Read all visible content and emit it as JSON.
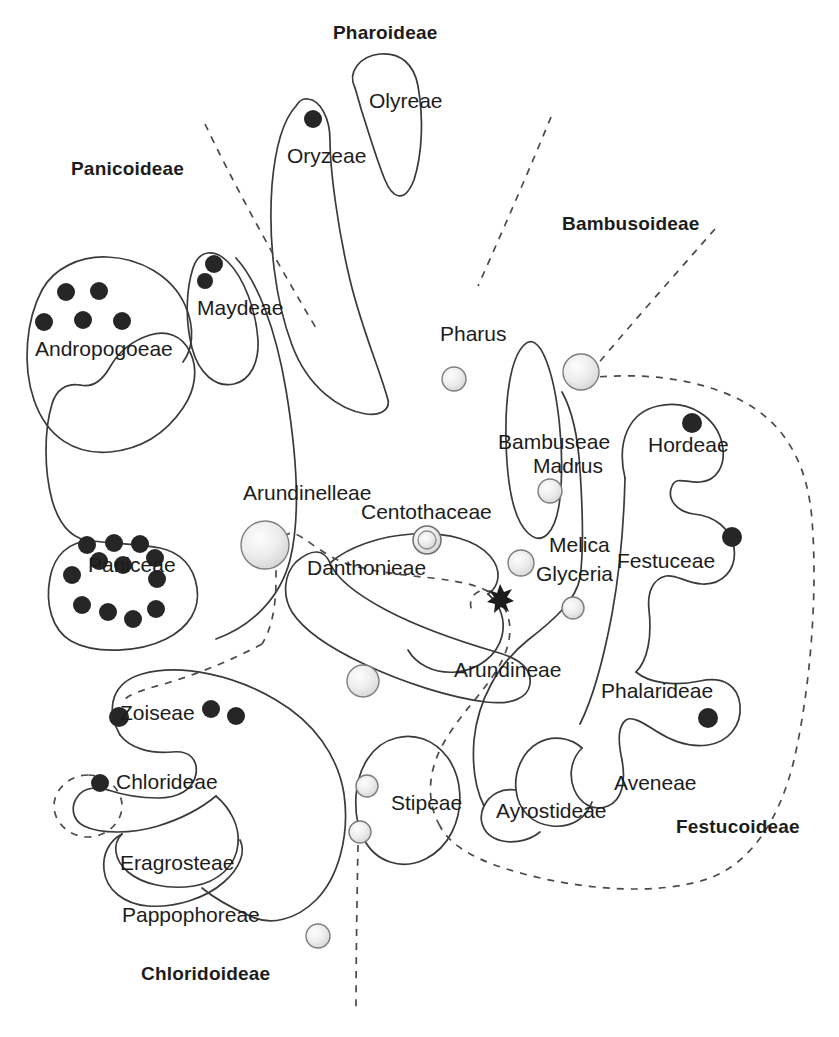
{
  "diagram": {
    "title_present": false,
    "type": "taxonomic-cluster-venn",
    "colors": {
      "outline": "#3a3a3a",
      "dashed_boundary": "#4a4a4a",
      "dark_marker": "#262626",
      "light_marker_fill": "#e8e8e8",
      "light_marker_stroke": "#7d7d7d",
      "text": "#1c1c1c",
      "background": "#ffffff"
    },
    "subfamilies": [
      {
        "id": "pharoideae",
        "label": "Pharoideae",
        "x": 333,
        "y": 22,
        "bold": true
      },
      {
        "id": "panicoideae",
        "label": "Panicoideae",
        "x": 71,
        "y": 158,
        "bold": true
      },
      {
        "id": "bambusoideae",
        "label": "Bambusoideae",
        "x": 562,
        "y": 213,
        "bold": true
      },
      {
        "id": "festucoideae",
        "label": "Festucoideae",
        "x": 676,
        "y": 816,
        "bold": true
      },
      {
        "id": "chloridoideae",
        "label": "Chloridoideae",
        "x": 141,
        "y": 963,
        "bold": true
      }
    ],
    "tribes": [
      {
        "id": "olyreae",
        "label": "Olyreae",
        "x": 369,
        "y": 89,
        "markers_dark": 0,
        "markers_light": 0
      },
      {
        "id": "oryzeae",
        "label": "Oryzeae",
        "x": 287,
        "y": 144,
        "markers_dark": 1,
        "markers_light": 0
      },
      {
        "id": "maydeae",
        "label": "Maydeae",
        "x": 197,
        "y": 296,
        "markers_dark": 2,
        "markers_light": 0
      },
      {
        "id": "andropogoeae",
        "label": "Andropogoeae",
        "x": 35,
        "y": 337,
        "markers_dark": 5,
        "markers_light": 0
      },
      {
        "id": "pharus",
        "label": "Pharus",
        "x": 440,
        "y": 322,
        "markers_dark": 0,
        "markers_light": 1
      },
      {
        "id": "bambuseae",
        "label": "Bambuseae",
        "x": 498,
        "y": 430,
        "markers_dark": 0,
        "markers_light": 1
      },
      {
        "id": "madrus",
        "label": "Madrus",
        "x": 533,
        "y": 454,
        "markers_dark": 0,
        "markers_light": 1
      },
      {
        "id": "hordeae",
        "label": "Hordeae",
        "x": 648,
        "y": 433,
        "markers_dark": 1,
        "markers_light": 0
      },
      {
        "id": "arundinelleae",
        "label": "Arundinelleae",
        "x": 243,
        "y": 481,
        "markers_dark": 0,
        "markers_light": 1
      },
      {
        "id": "centothaceae",
        "label": "Centothaceae",
        "x": 361,
        "y": 500,
        "markers_dark": 0,
        "markers_light": 1
      },
      {
        "id": "melica",
        "label": "Melica",
        "x": 549,
        "y": 533,
        "markers_dark": 0,
        "markers_light": 1
      },
      {
        "id": "festuceae",
        "label": "Festuceae",
        "x": 617,
        "y": 549,
        "markers_dark": 1,
        "markers_light": 0
      },
      {
        "id": "paniceae",
        "label": "Paniceae",
        "x": 88,
        "y": 553,
        "markers_dark": 12,
        "markers_light": 0
      },
      {
        "id": "danthonieae",
        "label": "Danthonieae",
        "x": 307,
        "y": 556,
        "markers_dark": 0,
        "markers_light": 0
      },
      {
        "id": "glyceria",
        "label": "Glyceria",
        "x": 536,
        "y": 562,
        "markers_dark": 0,
        "markers_light": 1
      },
      {
        "id": "arundineae",
        "label": "Arundineae",
        "x": 454,
        "y": 658,
        "markers_dark": 0,
        "markers_light": 1
      },
      {
        "id": "phalarideae",
        "label": "Phalarideae",
        "x": 601,
        "y": 679,
        "markers_dark": 1,
        "markers_light": 0
      },
      {
        "id": "zoiseae",
        "label": "Zoiseae",
        "x": 120,
        "y": 701,
        "markers_dark": 3,
        "markers_light": 0
      },
      {
        "id": "chlorideae",
        "label": "Chlorideae",
        "x": 116,
        "y": 770,
        "markers_dark": 1,
        "markers_light": 0
      },
      {
        "id": "aveneae",
        "label": "Aveneae",
        "x": 614,
        "y": 771,
        "markers_dark": 0,
        "markers_light": 0
      },
      {
        "id": "stipeae",
        "label": "Stipeae",
        "x": 391,
        "y": 791,
        "markers_dark": 0,
        "markers_light": 2
      },
      {
        "id": "ayrostideae",
        "label": "Ayrostideae",
        "x": 496,
        "y": 799,
        "markers_dark": 0,
        "markers_light": 0
      },
      {
        "id": "eragrosteae",
        "label": "Eragrosteae",
        "x": 120,
        "y": 851,
        "markers_dark": 0,
        "markers_light": 0
      },
      {
        "id": "pappophoreae",
        "label": "Pappophoreae",
        "x": 122,
        "y": 903,
        "markers_dark": 0,
        "markers_light": 0
      }
    ],
    "markers": {
      "dark_dots": [
        {
          "cx": 313,
          "cy": 119,
          "r": 9,
          "tribe": "oryzeae"
        },
        {
          "cx": 214,
          "cy": 264,
          "r": 9,
          "tribe": "maydeae"
        },
        {
          "cx": 205,
          "cy": 281,
          "r": 8,
          "tribe": "maydeae"
        },
        {
          "cx": 66,
          "cy": 292,
          "r": 9,
          "tribe": "andropogoeae"
        },
        {
          "cx": 99,
          "cy": 291,
          "r": 9,
          "tribe": "andropogoeae"
        },
        {
          "cx": 44,
          "cy": 322,
          "r": 9,
          "tribe": "andropogoeae"
        },
        {
          "cx": 83,
          "cy": 320,
          "r": 9,
          "tribe": "andropogoeae"
        },
        {
          "cx": 122,
          "cy": 321,
          "r": 9,
          "tribe": "andropogoeae"
        },
        {
          "cx": 692,
          "cy": 423,
          "r": 10,
          "tribe": "hordeae"
        },
        {
          "cx": 732,
          "cy": 537,
          "r": 10,
          "tribe": "festuceae"
        },
        {
          "cx": 87,
          "cy": 545,
          "r": 9,
          "tribe": "paniceae"
        },
        {
          "cx": 114,
          "cy": 543,
          "r": 9,
          "tribe": "paniceae"
        },
        {
          "cx": 140,
          "cy": 544,
          "r": 9,
          "tribe": "paniceae"
        },
        {
          "cx": 155,
          "cy": 558,
          "r": 9,
          "tribe": "paniceae"
        },
        {
          "cx": 99,
          "cy": 561,
          "r": 9,
          "tribe": "paniceae"
        },
        {
          "cx": 123,
          "cy": 565,
          "r": 9,
          "tribe": "paniceae"
        },
        {
          "cx": 72,
          "cy": 575,
          "r": 9,
          "tribe": "paniceae"
        },
        {
          "cx": 82,
          "cy": 605,
          "r": 9,
          "tribe": "paniceae"
        },
        {
          "cx": 108,
          "cy": 612,
          "r": 9,
          "tribe": "paniceae"
        },
        {
          "cx": 133,
          "cy": 619,
          "r": 9,
          "tribe": "paniceae"
        },
        {
          "cx": 156,
          "cy": 609,
          "r": 9,
          "tribe": "paniceae"
        },
        {
          "cx": 157,
          "cy": 579,
          "r": 9,
          "tribe": "paniceae"
        },
        {
          "cx": 708,
          "cy": 718,
          "r": 10,
          "tribe": "phalarideae"
        },
        {
          "cx": 119,
          "cy": 717,
          "r": 10,
          "tribe": "zoiseae"
        },
        {
          "cx": 211,
          "cy": 709,
          "r": 9,
          "tribe": "zoiseae"
        },
        {
          "cx": 236,
          "cy": 716,
          "r": 9,
          "tribe": "zoiseae"
        },
        {
          "cx": 100,
          "cy": 783,
          "r": 9,
          "tribe": "chlorideae"
        }
      ],
      "light_circles": [
        {
          "cx": 454,
          "cy": 379,
          "r": 12,
          "tribe": "pharus"
        },
        {
          "cx": 581,
          "cy": 372,
          "r": 18,
          "tribe": "bambuseae"
        },
        {
          "cx": 550,
          "cy": 491,
          "r": 12,
          "tribe": "madrus"
        },
        {
          "cx": 265,
          "cy": 545,
          "r": 24,
          "tribe": "arundinelleae"
        },
        {
          "cx": 427,
          "cy": 540,
          "r": 14,
          "tribe": "centothaceae",
          "double_ring": true
        },
        {
          "cx": 521,
          "cy": 563,
          "r": 13,
          "tribe": "melica"
        },
        {
          "cx": 573,
          "cy": 608,
          "r": 11,
          "tribe": "glyceria"
        },
        {
          "cx": 363,
          "cy": 681,
          "r": 16,
          "tribe": "arundineae"
        },
        {
          "cx": 367,
          "cy": 786,
          "r": 11,
          "tribe": "stipeae"
        },
        {
          "cx": 360,
          "cy": 832,
          "r": 11,
          "tribe": "stipeae"
        },
        {
          "cx": 318,
          "cy": 936,
          "r": 12,
          "tribe": "chloridoideae-outer"
        }
      ],
      "stars": [
        {
          "cx": 500,
          "cy": 596,
          "r": 11,
          "points": 6
        }
      ]
    },
    "dashed_boundaries": [
      {
        "id": "panicoideae-pharoideae-divider"
      },
      {
        "id": "pharoideae-bambusoideae-divider"
      },
      {
        "id": "bambusoideae-upper-divider"
      },
      {
        "id": "festucoideae-envelope"
      },
      {
        "id": "danthonieae-arundinelleae-envelope"
      },
      {
        "id": "chloridoideae-upper-divider"
      },
      {
        "id": "chloridoideae-lower-divider"
      },
      {
        "id": "chlorideae-small-circle"
      }
    ]
  }
}
